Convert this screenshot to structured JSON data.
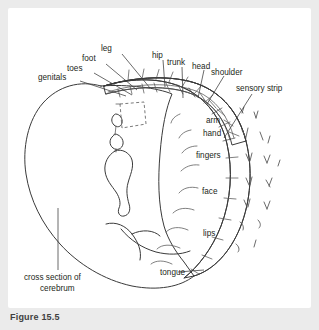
{
  "figure": {
    "caption": "Figure 15.5",
    "panel_background": "#ffffff",
    "page_background": "#ebebeb",
    "line_color": "#3a3a3a",
    "cortex_fill": "#f0f0f0",
    "band_fill": "#f3f3f3",
    "label_color": "#231f20"
  },
  "labels": {
    "genitals": "genitals",
    "toes": "toes",
    "foot": "foot",
    "leg": "leg",
    "hip": "hip",
    "trunk": "trunk",
    "head": "head",
    "shoulder": "shoulder",
    "sensory_strip": "sensory strip",
    "arm": "arm",
    "hand": "hand",
    "fingers": "fingers",
    "face": "face",
    "lips": "lips",
    "tongue": "tongue",
    "cross_section_line1": "cross section of",
    "cross_section_line2": "cerebrum"
  },
  "homunculus_order": [
    "genitals",
    "toes",
    "foot",
    "leg",
    "hip",
    "trunk",
    "head",
    "shoulder",
    "arm",
    "hand",
    "fingers",
    "face",
    "lips",
    "tongue"
  ]
}
